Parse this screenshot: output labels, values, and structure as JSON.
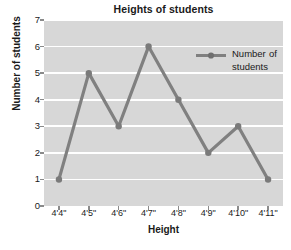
{
  "chart_data": {
    "type": "line",
    "title": "Heights of students",
    "xlabel": "Height",
    "ylabel": "Number of students",
    "categories": [
      "4'4\"",
      "4'5\"",
      "4'6\"",
      "4'7\"",
      "4'8\"",
      "4'9\"",
      "4'10\"",
      "4'11\""
    ],
    "values": [
      1,
      5,
      3,
      6,
      4,
      2,
      3,
      1
    ],
    "series": [
      {
        "name": "Number of students",
        "values": [
          1,
          5,
          3,
          6,
          4,
          2,
          3,
          1
        ]
      }
    ],
    "ylim": [
      0,
      7
    ],
    "yticks": [
      0,
      1,
      2,
      3,
      4,
      5,
      6,
      7
    ],
    "ytick_labels": [
      "0",
      "1",
      "2",
      "3",
      "4",
      "5",
      "6",
      "7"
    ],
    "grid": true,
    "grid_axis": "y",
    "legend": {
      "position": "upper-right",
      "entries": [
        "Number of students"
      ],
      "marker": "circle",
      "line_style": "solid"
    },
    "colors": {
      "plot_background": "#d7d7d7",
      "figure_background": "#ffffff",
      "gridline": "#ffffff",
      "series_line": "#808080",
      "marker": "#7a7a7a",
      "text": "#1a1a1a",
      "tick_mark": "#8a8a8a"
    }
  }
}
